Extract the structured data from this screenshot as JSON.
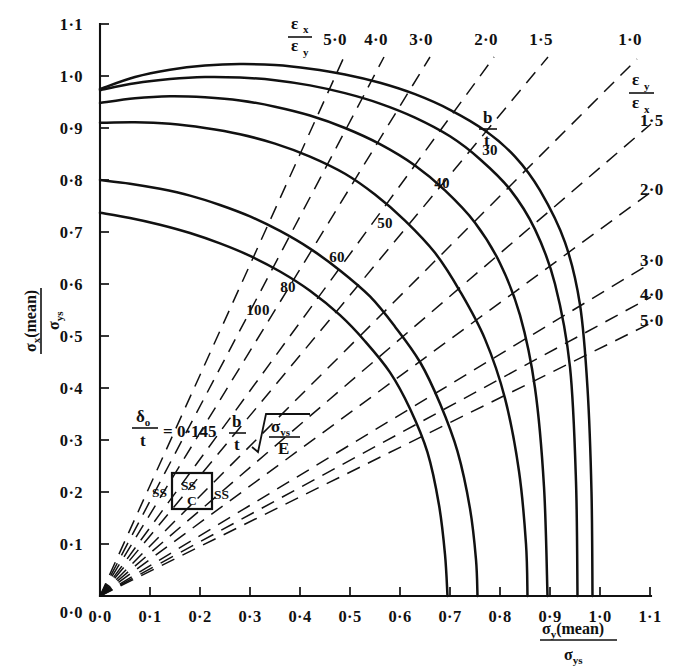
{
  "chart_data": {
    "type": "line",
    "title": "",
    "xlabel": "σy(mean) / σys",
    "ylabel": "σx(mean) / σys",
    "xlim": [
      0.0,
      1.1
    ],
    "ylim": [
      0.0,
      1.1
    ],
    "grid": false,
    "x_ticks": [
      "0·0",
      "0·1",
      "0·2",
      "0·3",
      "0·4",
      "0·5",
      "0·6",
      "0·7",
      "0·8",
      "0·9",
      "1·0",
      "1·1"
    ],
    "x_tick_values": [
      0.0,
      0.1,
      0.2,
      0.3,
      0.4,
      0.5,
      0.6,
      0.7,
      0.8,
      0.9,
      1.0,
      1.1
    ],
    "y_ticks": [
      "0·0",
      "0·1",
      "0·2",
      "0·3",
      "0·4",
      "0·5",
      "0·6",
      "0·7",
      "0·8",
      "0·9",
      "1·0",
      "1·1"
    ],
    "y_tick_values": [
      0.0,
      0.1,
      0.2,
      0.3,
      0.4,
      0.5,
      0.6,
      0.7,
      0.8,
      0.9,
      1.0,
      1.1
    ],
    "series_family_label": "b/t",
    "series": [
      {
        "name": "30",
        "label": "30",
        "x": [
          0.0,
          0.07,
          0.14,
          0.21,
          0.28,
          0.35,
          0.42,
          0.49,
          0.56,
          0.63,
          0.7,
          0.77,
          0.83,
          0.88,
          0.93,
          0.96,
          0.975,
          0.983,
          0.985
        ],
        "y": [
          0.975,
          0.998,
          1.012,
          1.02,
          1.023,
          1.021,
          1.014,
          1.003,
          0.987,
          0.965,
          0.935,
          0.895,
          0.845,
          0.78,
          0.68,
          0.56,
          0.4,
          0.2,
          0.0
        ]
      },
      {
        "name": "40",
        "label": "40",
        "x": [
          0.0,
          0.07,
          0.14,
          0.21,
          0.28,
          0.35,
          0.42,
          0.49,
          0.56,
          0.63,
          0.7,
          0.76,
          0.82,
          0.87,
          0.91,
          0.94,
          0.952,
          0.955
        ],
        "y": [
          0.973,
          0.986,
          0.994,
          0.998,
          0.997,
          0.992,
          0.982,
          0.967,
          0.947,
          0.92,
          0.884,
          0.84,
          0.782,
          0.705,
          0.6,
          0.44,
          0.22,
          0.0
        ]
      },
      {
        "name": "50",
        "label": "50",
        "x": [
          0.0,
          0.07,
          0.14,
          0.21,
          0.28,
          0.35,
          0.42,
          0.49,
          0.56,
          0.63,
          0.69,
          0.75,
          0.8,
          0.84,
          0.87,
          0.888,
          0.895
        ],
        "y": [
          0.948,
          0.957,
          0.961,
          0.959,
          0.953,
          0.941,
          0.924,
          0.9,
          0.869,
          0.828,
          0.78,
          0.718,
          0.64,
          0.54,
          0.4,
          0.21,
          0.0
        ]
      },
      {
        "name": "60",
        "label": "60",
        "x": [
          0.0,
          0.07,
          0.14,
          0.21,
          0.28,
          0.35,
          0.42,
          0.49,
          0.55,
          0.61,
          0.67,
          0.72,
          0.77,
          0.81,
          0.838,
          0.852,
          0.855
        ],
        "y": [
          0.91,
          0.911,
          0.908,
          0.9,
          0.888,
          0.87,
          0.845,
          0.812,
          0.772,
          0.722,
          0.66,
          0.586,
          0.494,
          0.38,
          0.24,
          0.1,
          0.0
        ]
      },
      {
        "name": "80",
        "label": "80",
        "x": [
          0.0,
          0.06,
          0.12,
          0.18,
          0.24,
          0.3,
          0.36,
          0.42,
          0.48,
          0.54,
          0.59,
          0.64,
          0.68,
          0.715,
          0.74,
          0.752,
          0.755
        ],
        "y": [
          0.8,
          0.793,
          0.783,
          0.77,
          0.752,
          0.73,
          0.702,
          0.668,
          0.626,
          0.576,
          0.518,
          0.45,
          0.37,
          0.278,
          0.168,
          0.07,
          0.0
        ]
      },
      {
        "name": "100",
        "label": "100",
        "x": [
          0.0,
          0.06,
          0.12,
          0.18,
          0.24,
          0.3,
          0.36,
          0.42,
          0.48,
          0.53,
          0.58,
          0.62,
          0.655,
          0.678,
          0.69,
          0.695
        ],
        "y": [
          0.737,
          0.727,
          0.714,
          0.698,
          0.678,
          0.654,
          0.624,
          0.587,
          0.54,
          0.49,
          0.43,
          0.36,
          0.276,
          0.175,
          0.08,
          0.0
        ]
      }
    ],
    "ray_family_upper_label": "εx / εy",
    "ray_family_lower_label": "εy / εx",
    "rays": [
      {
        "label": "5·0",
        "ratio": 5.0,
        "side": "top",
        "label_x": 335,
        "label_y": 45,
        "x1": 100,
        "y1": 596,
        "x2": 344,
        "y2": 57
      },
      {
        "label": "4·0",
        "ratio": 4.0,
        "side": "top",
        "label_x": 376,
        "label_y": 45,
        "x1": 100,
        "y1": 596,
        "x2": 384,
        "y2": 57
      },
      {
        "label": "3·0",
        "ratio": 3.0,
        "side": "top",
        "label_x": 421,
        "label_y": 45,
        "x1": 100,
        "y1": 596,
        "x2": 430,
        "y2": 57
      },
      {
        "label": "2·0",
        "ratio": 2.0,
        "side": "top",
        "label_x": 486,
        "label_y": 45,
        "x1": 100,
        "y1": 596,
        "x2": 494,
        "y2": 57
      },
      {
        "label": "1·5",
        "ratio": 1.5,
        "side": "top",
        "label_x": 541,
        "label_y": 45,
        "x1": 100,
        "y1": 596,
        "x2": 548,
        "y2": 57
      },
      {
        "label": "1·0",
        "ratio": 1.0,
        "side": "top",
        "label_x": 630,
        "label_y": 45,
        "x1": 100,
        "y1": 596,
        "x2": 637,
        "y2": 59
      },
      {
        "label": "1·5",
        "ratio": 0.667,
        "side": "right",
        "label_x": 640,
        "label_y": 126,
        "x1": 100,
        "y1": 596,
        "x2": 651,
        "y2": 124
      },
      {
        "label": "2·0",
        "ratio": 0.5,
        "side": "right",
        "label_x": 640,
        "label_y": 195,
        "x1": 100,
        "y1": 596,
        "x2": 651,
        "y2": 192
      },
      {
        "label": "3·0",
        "ratio": 0.333,
        "side": "right",
        "label_x": 640,
        "label_y": 266,
        "x1": 100,
        "y1": 596,
        "x2": 651,
        "y2": 263
      },
      {
        "label": "4·0",
        "ratio": 0.25,
        "side": "right",
        "label_x": 640,
        "label_y": 300,
        "x1": 100,
        "y1": 596,
        "x2": 651,
        "y2": 297
      },
      {
        "label": "5·0",
        "ratio": 0.2,
        "side": "right",
        "label_x": 640,
        "label_y": 326,
        "x1": 100,
        "y1": 596,
        "x2": 651,
        "y2": 323
      }
    ],
    "curve_labels": [
      {
        "text": "30",
        "x": 490,
        "y": 155
      },
      {
        "text": "40",
        "x": 442,
        "y": 188
      },
      {
        "text": "50",
        "x": 385,
        "y": 228
      },
      {
        "text": "60",
        "x": 337,
        "y": 262
      },
      {
        "text": "80",
        "x": 288,
        "y": 292
      },
      {
        "text": "100",
        "x": 258,
        "y": 315
      }
    ],
    "annotation_formula": {
      "delta": "δ",
      "delta_sub": "o",
      "denominator": "t",
      "equals": "= 0·145",
      "b": "b",
      "t": "t",
      "radicand_numerator": "σ",
      "radicand_numerator_sub": "ys",
      "radicand_denominator": "E",
      "plain_text": "δo/t = 0·145 (b/t) √(σys/E)"
    },
    "boundary_diagram": {
      "left_label": "SS",
      "right_label": "SS",
      "top_label": "SS",
      "bottom_label": "C"
    }
  },
  "axes": {
    "y_axis_title_main": "σ",
    "y_axis_title_sub": "x",
    "y_axis_title_paren": "(mean)",
    "y_axis_title_denom": "σ",
    "y_axis_title_denom_sub": "ys",
    "x_axis_title_main": "σ",
    "x_axis_title_sub": "y",
    "x_axis_title_paren": "(mean)",
    "x_axis_title_denom": "σ",
    "x_axis_title_denom_sub": "ys"
  },
  "colors": {
    "ink": "#111111",
    "paper": "#ffffff"
  }
}
